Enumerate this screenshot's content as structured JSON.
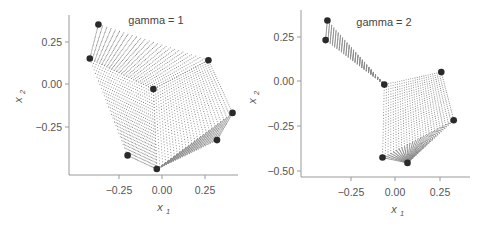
{
  "chart_data": [
    {
      "type": "scatter",
      "title": "gamma = 1",
      "xlabel": "x1",
      "ylabel": "x2",
      "xticks": [
        "-0.25",
        "0.00",
        "0.25"
      ],
      "yticks": [
        "0.25",
        "0.00",
        "-0.25"
      ],
      "xlim": [
        -0.55,
        0.42
      ],
      "ylim": [
        -0.53,
        0.4
      ],
      "grid": false,
      "legend": null,
      "description": "Dense grid of small gray dots forming a warped surface (mesh) spanned by the large dark control points",
      "control_points": [
        {
          "x": -0.37,
          "y": 0.35
        },
        {
          "x": -0.42,
          "y": 0.15
        },
        {
          "x": 0.27,
          "y": 0.14
        },
        {
          "x": -0.05,
          "y": -0.03
        },
        {
          "x": 0.41,
          "y": -0.17
        },
        {
          "x": 0.32,
          "y": -0.33
        },
        {
          "x": -0.2,
          "y": -0.42
        },
        {
          "x": -0.03,
          "y": -0.5
        }
      ]
    },
    {
      "type": "scatter",
      "title": "gamma = 2",
      "xlabel": "x1",
      "ylabel": "x2",
      "xticks": [
        "-0.25",
        "0.00",
        "0.25"
      ],
      "yticks": [
        "0.25",
        "0.00",
        "-0.25",
        "-0.50"
      ],
      "xlim": [
        -0.53,
        0.42
      ],
      "ylim": [
        -0.54,
        0.4
      ],
      "grid": false,
      "legend": null,
      "description": "Dense grid of small gray dots forming a more sharply warped surface spanned by the large dark control points",
      "control_points": [
        {
          "x": -0.38,
          "y": 0.34
        },
        {
          "x": -0.39,
          "y": 0.23
        },
        {
          "x": 0.26,
          "y": 0.05
        },
        {
          "x": -0.06,
          "y": -0.02
        },
        {
          "x": 0.33,
          "y": -0.22
        },
        {
          "x": -0.07,
          "y": -0.43
        },
        {
          "x": 0.07,
          "y": -0.46
        }
      ]
    }
  ],
  "panels": [
    {
      "title": "gamma = 1",
      "xlabel_main": "x",
      "xlabel_sub": "1",
      "ylabel_main": "x",
      "ylabel_sub": "2",
      "xticks": [
        "−0.25",
        "0.00",
        "0.25"
      ],
      "yticks": [
        "0.25",
        "0.00",
        "−0.25"
      ]
    },
    {
      "title": "gamma = 2",
      "xlabel_main": "x",
      "xlabel_sub": "1",
      "ylabel_main": "x",
      "ylabel_sub": "2",
      "xticks": [
        "−0.25",
        "0.00",
        "0.25"
      ],
      "yticks": [
        "0.25",
        "0.00",
        "−0.25",
        "−0.50"
      ]
    }
  ],
  "colors": {
    "mesh_dots": "#8a8a8a",
    "control_points": "#2a2a2a",
    "axes": "#9a9a9a",
    "text": "#555555"
  }
}
